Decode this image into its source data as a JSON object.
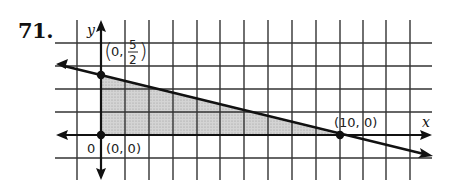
{
  "problem": {
    "number": "71."
  },
  "graph": {
    "x_axis_label": "x",
    "y_axis_label": "y",
    "origin_label": "0",
    "points": [
      {
        "name": "origin",
        "label": "(0, 0)",
        "x": 0,
        "y": 0
      },
      {
        "name": "y-intercept",
        "label_prefix": "(0,",
        "label_num": "5",
        "label_den": "2",
        "label_suffix": ")",
        "x": 0,
        "y": 2.5
      },
      {
        "name": "x-intercept",
        "label": "(10, 0)",
        "x": 10,
        "y": 0
      }
    ],
    "boundary_line": "x + 4y = 10",
    "shaded_region": "triangle with vertices (0,0), (0,5/2), (10,0)",
    "colors": {
      "grid": "#333333",
      "shade": "#c8c8c8",
      "line": "#111111"
    }
  }
}
